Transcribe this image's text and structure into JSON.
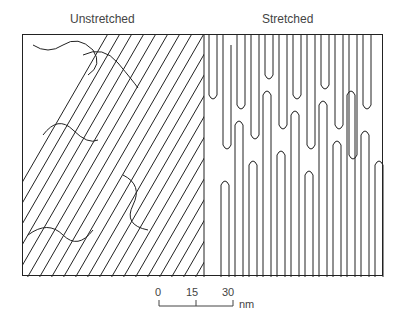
{
  "figure": {
    "panels": [
      {
        "label": "Unstretched",
        "pattern": "diagonal-lamellae"
      },
      {
        "label": "Stretched",
        "pattern": "vertical-lamellae"
      }
    ],
    "scale_bar": {
      "ticks": [
        "0",
        "15",
        "30"
      ],
      "unit": "nm"
    },
    "colors": {
      "line": "#222222",
      "background": "#ffffff"
    }
  }
}
